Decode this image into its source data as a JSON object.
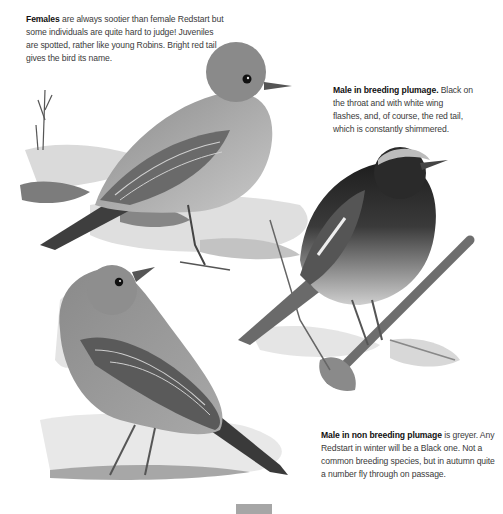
{
  "captions": {
    "female": {
      "title": "Females",
      "body": " are always sootier than female Redstart but some individuals are quite hard to judge! Juveniles are spotted, rather like young Robins. Bright red tail gives the bird its name."
    },
    "male_breeding": {
      "title": "Male in breeding plumage.",
      "body": " Black on the throat and with white wing flashes, and, of course, the red tail, which is constantly shimmered."
    },
    "male_nonbreeding": {
      "title": "Male in non breeding plumage",
      "body": " is greyer. Any Redstart in winter will be a Black one. Not a common breeding species, but in autumn quite a number fly through on passage."
    }
  },
  "illustrations": [
    {
      "name": "female-redstart",
      "subject": "Female Black Redstart perched on rock"
    },
    {
      "name": "male-breeding-redstart",
      "subject": "Male Black Redstart in breeding plumage on lichen branch"
    },
    {
      "name": "male-nonbreeding-redstart",
      "subject": "Male Black Redstart in non breeding plumage standing on ground"
    }
  ]
}
